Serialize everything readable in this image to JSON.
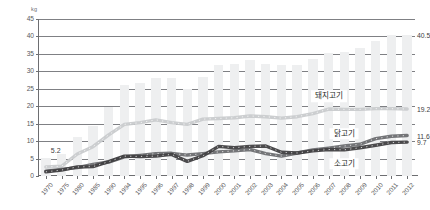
{
  "chart_data": {
    "type": "line",
    "title": "",
    "xlabel": "",
    "ylabel": "kg",
    "unit": "kg",
    "ylim": [
      0,
      45
    ],
    "ytick_values": [
      0,
      5,
      10,
      15,
      20,
      25,
      30,
      35,
      40,
      45
    ],
    "ytick_labels": [
      "0",
      "5",
      "10",
      "15",
      "20",
      "25",
      "30",
      "35",
      "40",
      "45"
    ],
    "grid": true,
    "legend_position": "inline-right",
    "categories": [
      "1970",
      "1975",
      "1980",
      "1985",
      "1990",
      "1994",
      "1995",
      "1996",
      "1997",
      "1998",
      "1999",
      "2000",
      "2001",
      "2002",
      "2003",
      "2004",
      "2005",
      "2006",
      "2007",
      "2008",
      "2009",
      "2010",
      "2011",
      "2012"
    ],
    "bars": {
      "name": "total",
      "color": "#eeeff0",
      "values": [
        5.2,
        6.4,
        11.3,
        14.4,
        19.9,
        26.0,
        26.8,
        28.2,
        28.0,
        25.0,
        28.5,
        31.9,
        32.0,
        33.3,
        32.0,
        31.9,
        31.9,
        33.5,
        35.4,
        35.6,
        36.8,
        38.8,
        40.4,
        40.5
      ]
    },
    "series": [
      {
        "name": "돼지고기",
        "label_en": "pork",
        "color": "#c9cbcd",
        "end_value": "19.2",
        "values": [
          2.6,
          2.8,
          6.3,
          8.4,
          11.8,
          14.8,
          15.3,
          16.1,
          15.3,
          14.8,
          16.3,
          16.5,
          16.7,
          17.2,
          17.0,
          16.6,
          17.0,
          17.9,
          19.2,
          19.1,
          19.1,
          19.3,
          19.3,
          19.2
        ]
      },
      {
        "name": "닭고기",
        "label_en": "chicken",
        "color": "#6d6e71",
        "end_value": "11.6",
        "values": [
          1.4,
          1.9,
          2.4,
          3.3,
          4.0,
          5.5,
          5.9,
          6.4,
          6.5,
          6.0,
          6.4,
          6.9,
          7.2,
          7.6,
          6.4,
          5.7,
          6.6,
          7.5,
          8.0,
          8.6,
          9.1,
          10.7,
          11.4,
          11.6
        ]
      },
      {
        "name": "소고기",
        "label_en": "beef",
        "color": "#414042",
        "end_value": "9.7",
        "values": [
          1.2,
          1.7,
          2.6,
          2.7,
          4.1,
          5.7,
          5.6,
          5.7,
          6.2,
          4.2,
          5.8,
          8.5,
          8.1,
          8.5,
          8.6,
          6.8,
          6.6,
          7.2,
          7.6,
          7.5,
          8.1,
          8.8,
          9.6,
          9.7
        ]
      }
    ],
    "annotations": [
      {
        "text": "5.2",
        "at_category": "1970",
        "value": 5.2
      },
      {
        "text": "40.5",
        "at_category": "2012",
        "value": 40.5
      }
    ]
  }
}
